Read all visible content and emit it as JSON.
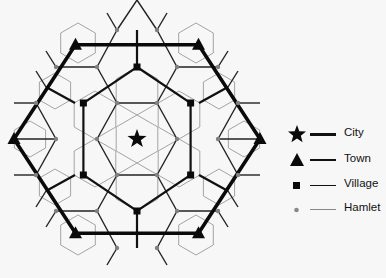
{
  "diagram": {
    "center": [
      137,
      139
    ],
    "colors": {
      "background": "#f7f7f7",
      "city": "#111111",
      "town": "#111111",
      "village": "#111111",
      "hamlet": "#888888",
      "hamlet_line": "#999999"
    }
  },
  "legend": {
    "items": [
      {
        "label": "City",
        "symbol": "star",
        "line": "thickest"
      },
      {
        "label": "Town",
        "symbol": "triangle",
        "line": "thick"
      },
      {
        "label": "Village",
        "symbol": "square",
        "line": "medium"
      },
      {
        "label": "Hamlet",
        "symbol": "dot",
        "line": "thin"
      }
    ]
  }
}
